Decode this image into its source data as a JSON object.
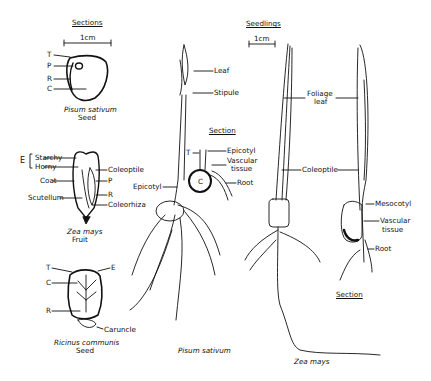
{
  "figure": {
    "seed_panel": {
      "heading": "Sections",
      "scale": "1cm",
      "pisum_seed": {
        "labels": [
          "T",
          "P",
          "R",
          "C"
        ],
        "species": "Pisum sativum",
        "part": "Seed"
      },
      "zea_fruit": {
        "bracket_label": "E",
        "labels_left": [
          "Starchy",
          "Horny",
          "Coat",
          "Scutellum"
        ],
        "labels_right": [
          "Coleoptile",
          "P",
          "R",
          "Coleorhiza"
        ],
        "species": "Zea mays",
        "part": "Fruit"
      },
      "ricinus_seed": {
        "labels_left": [
          "T",
          "C",
          "R"
        ],
        "labels_right": [
          "E",
          "Caruncle"
        ],
        "species": "Ricinus communis",
        "part": "Seed"
      }
    },
    "pisum_seedling": {
      "labels": [
        "Leaf",
        "Stipule",
        "Epicotyl"
      ],
      "section": {
        "heading": "Section",
        "labels": [
          "T",
          "Epicotyl",
          "Vascular",
          "tissue",
          "C",
          "Root"
        ]
      },
      "species": "Pisum sativum"
    },
    "zea_seedling": {
      "heading": "Seedlings",
      "scale": "1cm",
      "labels": [
        "Foliage",
        "leaf",
        "Coleoptile",
        "Mesocotyl",
        "Vascular",
        "tissue",
        "Root"
      ],
      "section_heading": "Section",
      "species": "Zea mays"
    }
  }
}
